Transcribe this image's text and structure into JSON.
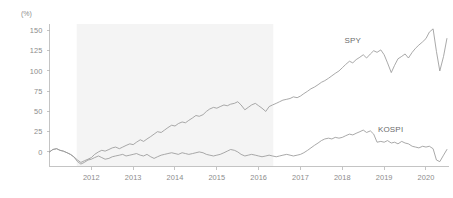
{
  "chart_data": {
    "type": "line",
    "title": "",
    "subtitle": "",
    "xlabel": "",
    "ylabel": "",
    "unit_label": "(%)",
    "grid": false,
    "legend_position": "inline-right",
    "xlim": [
      2011.0,
      2020.55
    ],
    "ylim": [
      -18,
      158
    ],
    "y_ticks": [
      0,
      25,
      50,
      75,
      100,
      125,
      150
    ],
    "y_tick_labels": [
      "0",
      "25",
      "50",
      "75",
      "100",
      "125",
      "150"
    ],
    "x_ticks": [
      2012,
      2013,
      2014,
      2015,
      2016,
      2017,
      2018,
      2019,
      2020
    ],
    "x_tick_labels": [
      "2012",
      "2013",
      "2014",
      "2015",
      "2016",
      "2017",
      "2018",
      "2019",
      "2020"
    ],
    "annotations": [
      {
        "name": "shaded-period",
        "type": "vband",
        "x0": 2011.65,
        "x1": 2016.35,
        "color": "#f4f4f4"
      }
    ],
    "series": [
      {
        "name": "SPY",
        "color": "#9a9a9a",
        "label_x": 2018.05,
        "label_y": 134,
        "x": [
          2011.0,
          2011.08,
          2011.17,
          2011.25,
          2011.33,
          2011.42,
          2011.5,
          2011.58,
          2011.67,
          2011.75,
          2011.83,
          2011.92,
          2012.0,
          2012.08,
          2012.17,
          2012.25,
          2012.33,
          2012.42,
          2012.5,
          2012.58,
          2012.67,
          2012.75,
          2012.83,
          2012.92,
          2013.0,
          2013.08,
          2013.17,
          2013.25,
          2013.33,
          2013.42,
          2013.5,
          2013.58,
          2013.67,
          2013.75,
          2013.83,
          2013.92,
          2014.0,
          2014.08,
          2014.17,
          2014.25,
          2014.33,
          2014.42,
          2014.5,
          2014.58,
          2014.67,
          2014.75,
          2014.83,
          2014.92,
          2015.0,
          2015.08,
          2015.17,
          2015.25,
          2015.33,
          2015.42,
          2015.5,
          2015.58,
          2015.67,
          2015.75,
          2015.83,
          2015.92,
          2016.0,
          2016.08,
          2016.17,
          2016.25,
          2016.33,
          2016.42,
          2016.5,
          2016.58,
          2016.67,
          2016.75,
          2016.83,
          2016.92,
          2017.0,
          2017.08,
          2017.17,
          2017.25,
          2017.33,
          2017.42,
          2017.5,
          2017.58,
          2017.67,
          2017.75,
          2017.83,
          2017.92,
          2018.0,
          2018.08,
          2018.17,
          2018.25,
          2018.33,
          2018.42,
          2018.5,
          2018.58,
          2018.67,
          2018.75,
          2018.83,
          2018.92,
          2019.0,
          2019.08,
          2019.17,
          2019.25,
          2019.33,
          2019.42,
          2019.5,
          2019.58,
          2019.67,
          2019.75,
          2019.83,
          2019.92,
          2020.0,
          2020.08,
          2020.17,
          2020.25,
          2020.33,
          2020.42,
          2020.5
        ],
        "y": [
          0,
          3,
          4,
          2,
          1,
          -1,
          -3,
          -6,
          -10,
          -13,
          -11,
          -9,
          -7,
          -3,
          0,
          2,
          1,
          3,
          5,
          6,
          4,
          6,
          8,
          10,
          9,
          12,
          15,
          13,
          16,
          19,
          22,
          25,
          24,
          27,
          30,
          33,
          32,
          35,
          37,
          36,
          39,
          42,
          45,
          44,
          46,
          50,
          53,
          55,
          54,
          56,
          58,
          57,
          59,
          60,
          62,
          58,
          52,
          55,
          58,
          60,
          57,
          54,
          50,
          56,
          58,
          60,
          62,
          64,
          65,
          66,
          68,
          67,
          69,
          72,
          75,
          78,
          80,
          83,
          86,
          88,
          91,
          94,
          97,
          100,
          104,
          108,
          112,
          110,
          114,
          117,
          120,
          116,
          121,
          125,
          123,
          126,
          120,
          110,
          98,
          107,
          115,
          118,
          121,
          116,
          123,
          128,
          132,
          136,
          140,
          148,
          152,
          124,
          100,
          118,
          140
        ]
      },
      {
        "name": "KOSPI",
        "color": "#9a9a9a",
        "label_x": 2018.85,
        "label_y": 25,
        "x": [
          2011.0,
          2011.08,
          2011.17,
          2011.25,
          2011.33,
          2011.42,
          2011.5,
          2011.58,
          2011.67,
          2011.75,
          2011.83,
          2011.92,
          2012.0,
          2012.08,
          2012.17,
          2012.25,
          2012.33,
          2012.42,
          2012.5,
          2012.58,
          2012.67,
          2012.75,
          2012.83,
          2012.92,
          2013.0,
          2013.08,
          2013.17,
          2013.25,
          2013.33,
          2013.42,
          2013.5,
          2013.58,
          2013.67,
          2013.75,
          2013.83,
          2013.92,
          2014.0,
          2014.08,
          2014.17,
          2014.25,
          2014.33,
          2014.42,
          2014.5,
          2014.58,
          2014.67,
          2014.75,
          2014.83,
          2014.92,
          2015.0,
          2015.08,
          2015.17,
          2015.25,
          2015.33,
          2015.42,
          2015.5,
          2015.58,
          2015.67,
          2015.75,
          2015.83,
          2015.92,
          2016.0,
          2016.08,
          2016.17,
          2016.25,
          2016.33,
          2016.42,
          2016.5,
          2016.58,
          2016.67,
          2016.75,
          2016.83,
          2016.92,
          2017.0,
          2017.08,
          2017.17,
          2017.25,
          2017.33,
          2017.42,
          2017.5,
          2017.58,
          2017.67,
          2017.75,
          2017.83,
          2017.92,
          2018.0,
          2018.08,
          2018.17,
          2018.25,
          2018.33,
          2018.42,
          2018.5,
          2018.58,
          2018.67,
          2018.75,
          2018.83,
          2018.92,
          2019.0,
          2019.08,
          2019.17,
          2019.25,
          2019.33,
          2019.42,
          2019.5,
          2019.58,
          2019.67,
          2019.75,
          2019.83,
          2019.92,
          2020.0,
          2020.08,
          2020.17,
          2020.25,
          2020.33,
          2020.42,
          2020.5
        ],
        "y": [
          0,
          3,
          4,
          2,
          1,
          -1,
          -3,
          -6,
          -12,
          -15,
          -13,
          -10,
          -9,
          -7,
          -5,
          -7,
          -9,
          -8,
          -6,
          -5,
          -4,
          -3,
          -5,
          -4,
          -3,
          -2,
          -4,
          -5,
          -3,
          -6,
          -8,
          -6,
          -4,
          -3,
          -2,
          -1,
          -2,
          -3,
          -1,
          -2,
          -3,
          -2,
          -1,
          0,
          -1,
          -3,
          -4,
          -5,
          -4,
          -3,
          -1,
          1,
          3,
          2,
          0,
          -3,
          -5,
          -4,
          -3,
          -4,
          -5,
          -6,
          -5,
          -4,
          -5,
          -6,
          -5,
          -4,
          -3,
          -4,
          -5,
          -4,
          -3,
          -1,
          2,
          5,
          8,
          11,
          14,
          16,
          17,
          16,
          18,
          17,
          18,
          20,
          22,
          21,
          23,
          25,
          27,
          24,
          26,
          22,
          12,
          13,
          12,
          14,
          11,
          12,
          10,
          13,
          11,
          10,
          7,
          6,
          5,
          7,
          6,
          7,
          4,
          -10,
          -12,
          -4,
          3
        ]
      }
    ]
  }
}
